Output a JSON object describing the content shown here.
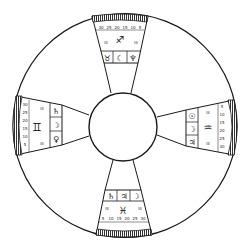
{
  "diagram": {
    "title": "Quadrant zodiac dial",
    "colors": {
      "ink": "#1a1a1a",
      "paper": "#ffffff",
      "hatch": "#444444"
    },
    "outer_ring": {
      "cx": 125,
      "cy": 125.5,
      "r": 112
    },
    "inner_hub": {
      "cx": 123,
      "cy": 127,
      "r": 34
    },
    "panels": [
      {
        "id": "top",
        "sign_symbol": "♐",
        "sign_name": "Sagittarius",
        "planet_symbols": [
          "♉",
          "☾",
          "♆"
        ],
        "scale_labels": [
          "30",
          "25",
          "20",
          "15",
          "10",
          "5"
        ],
        "side_labels": [
          "III",
          "III"
        ]
      },
      {
        "id": "right",
        "sign_symbol": "♒",
        "sign_name": "Aquarius",
        "planet_symbols": [
          "☉",
          "☽",
          "♃"
        ],
        "scale_labels": [
          "5",
          "10",
          "15",
          "20",
          "25",
          "30"
        ],
        "side_labels": [
          "III",
          "III"
        ]
      },
      {
        "id": "bottom",
        "sign_symbol": "♓",
        "sign_name": "Pisces",
        "planet_symbols": [
          "♄",
          "♃",
          "☽"
        ],
        "scale_labels": [
          "5",
          "10",
          "15",
          "20",
          "25",
          "30"
        ],
        "side_labels": [
          "III",
          "III"
        ]
      },
      {
        "id": "left",
        "sign_symbol": "♊",
        "sign_name": "Gemini",
        "planet_symbols": [
          "♄",
          "☽",
          "♀"
        ],
        "scale_labels": [
          "30",
          "25",
          "20",
          "15",
          "10",
          "5"
        ],
        "side_labels": [
          "III",
          "III"
        ]
      }
    ]
  }
}
